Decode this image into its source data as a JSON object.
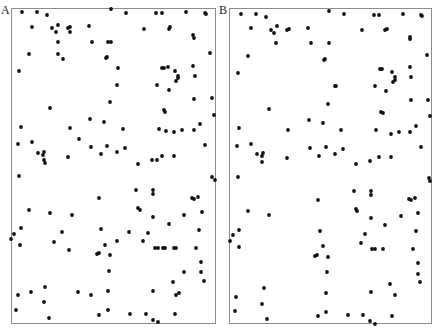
{
  "figure": {
    "panels": [
      {
        "label": "A",
        "frame": {
          "left": 11,
          "top": 8,
          "right": 215,
          "bottom": 323
        }
      },
      {
        "label": "B",
        "frame": {
          "left": 229,
          "top": 8,
          "right": 431,
          "bottom": 323
        }
      }
    ],
    "dot_color": "#111111",
    "frame_color": "#8c8c8c",
    "dot_radius": 1.9
  },
  "chart_data": [
    {
      "type": "scatter",
      "title": "A",
      "xlabel": "",
      "ylabel": "",
      "axes": "none",
      "grid": false,
      "legend": false,
      "coordinate_system": "image pixels (absolute)",
      "points": [
        [
          22,
          12
        ],
        [
          37,
          12
        ],
        [
          47,
          15
        ],
        [
          111,
          9
        ],
        [
          126,
          13
        ],
        [
          156,
          13
        ],
        [
          162,
          13
        ],
        [
          186,
          12
        ],
        [
          205,
          13
        ],
        [
          206,
          14
        ],
        [
          32,
          27
        ],
        [
          52,
          28
        ],
        [
          58,
          25
        ],
        [
          56,
          32
        ],
        [
          68,
          28
        ],
        [
          70,
          27
        ],
        [
          70,
          32
        ],
        [
          89,
          26
        ],
        [
          144,
          29
        ],
        [
          169,
          29
        ],
        [
          170,
          27
        ],
        [
          193,
          35
        ],
        [
          194,
          38
        ],
        [
          58,
          42
        ],
        [
          92,
          42
        ],
        [
          108,
          42
        ],
        [
          111,
          42
        ],
        [
          29,
          54
        ],
        [
          58,
          54
        ],
        [
          63,
          59
        ],
        [
          106,
          58
        ],
        [
          107,
          57
        ],
        [
          210,
          53
        ],
        [
          19,
          71
        ],
        [
          118,
          68
        ],
        [
          162,
          68
        ],
        [
          164,
          68
        ],
        [
          168,
          67
        ],
        [
          175,
          71
        ],
        [
          178,
          76
        ],
        [
          178,
          78
        ],
        [
          176,
          81
        ],
        [
          193,
          66
        ],
        [
          195,
          76
        ],
        [
          117,
          85
        ],
        [
          157,
          85
        ],
        [
          169,
          90
        ],
        [
          194,
          99
        ],
        [
          212,
          98
        ],
        [
          50,
          108
        ],
        [
          110,
          102
        ],
        [
          164,
          110
        ],
        [
          165,
          112
        ],
        [
          214,
          115
        ],
        [
          21,
          127
        ],
        [
          70,
          128
        ],
        [
          90,
          119
        ],
        [
          104,
          122
        ],
        [
          123,
          129
        ],
        [
          159,
          129
        ],
        [
          166,
          131
        ],
        [
          174,
          132
        ],
        [
          182,
          130
        ],
        [
          194,
          130
        ],
        [
          200,
          124
        ],
        [
          18,
          144
        ],
        [
          32,
          142
        ],
        [
          79,
          139
        ],
        [
          91,
          147
        ],
        [
          107,
          146
        ],
        [
          125,
          148
        ],
        [
          205,
          145
        ],
        [
          38,
          153
        ],
        [
          44,
          152
        ],
        [
          43,
          155
        ],
        [
          44,
          160
        ],
        [
          45,
          163
        ],
        [
          68,
          157
        ],
        [
          101,
          154
        ],
        [
          117,
          152
        ],
        [
          152,
          160
        ],
        [
          157,
          160
        ],
        [
          162,
          156
        ],
        [
          174,
          156
        ],
        [
          138,
          164
        ],
        [
          19,
          176
        ],
        [
          212,
          177
        ],
        [
          215,
          180
        ],
        [
          136,
          190
        ],
        [
          153,
          190
        ],
        [
          153,
          194
        ],
        [
          99,
          198
        ],
        [
          192,
          198
        ],
        [
          194,
          199
        ],
        [
          198,
          197
        ],
        [
          29,
          210
        ],
        [
          50,
          213
        ],
        [
          72,
          215
        ],
        [
          138,
          208
        ],
        [
          140,
          210
        ],
        [
          153,
          217
        ],
        [
          184,
          215
        ],
        [
          202,
          212
        ],
        [
          21,
          228
        ],
        [
          14,
          234
        ],
        [
          11,
          239
        ],
        [
          20,
          245
        ],
        [
          62,
          232
        ],
        [
          54,
          242
        ],
        [
          69,
          250
        ],
        [
          101,
          229
        ],
        [
          129,
          232
        ],
        [
          148,
          233
        ],
        [
          169,
          224
        ],
        [
          199,
          230
        ],
        [
          117,
          241
        ],
        [
          143,
          241
        ],
        [
          105,
          245
        ],
        [
          97,
          254
        ],
        [
          99,
          253
        ],
        [
          110,
          255
        ],
        [
          155,
          248
        ],
        [
          158,
          248
        ],
        [
          163,
          248
        ],
        [
          165,
          248
        ],
        [
          174,
          248
        ],
        [
          176,
          248
        ],
        [
          196,
          248
        ],
        [
          201,
          262
        ],
        [
          109,
          271
        ],
        [
          184,
          272
        ],
        [
          201,
          272
        ],
        [
          204,
          281
        ],
        [
          173,
          282
        ],
        [
          18,
          295
        ],
        [
          31,
          292
        ],
        [
          45,
          287
        ],
        [
          78,
          292
        ],
        [
          91,
          295
        ],
        [
          108,
          291
        ],
        [
          153,
          291
        ],
        [
          176,
          295
        ],
        [
          179,
          293
        ],
        [
          44,
          302
        ],
        [
          16,
          310
        ],
        [
          49,
          318
        ],
        [
          99,
          315
        ],
        [
          108,
          310
        ],
        [
          130,
          314
        ],
        [
          146,
          314
        ],
        [
          153,
          320
        ],
        [
          158,
          322
        ],
        [
          175,
          314
        ]
      ]
    },
    {
      "type": "scatter",
      "title": "B",
      "xlabel": "",
      "ylabel": "",
      "axes": "none",
      "grid": false,
      "legend": false,
      "coordinate_system": "image pixels (absolute)",
      "points": [
        [
          241,
          14
        ],
        [
          256,
          14
        ],
        [
          266,
          17
        ],
        [
          329,
          11
        ],
        [
          344,
          14
        ],
        [
          374,
          15
        ],
        [
          379,
          15
        ],
        [
          403,
          14
        ],
        [
          421,
          15
        ],
        [
          422,
          16
        ],
        [
          251,
          28
        ],
        [
          271,
          30
        ],
        [
          277,
          26
        ],
        [
          274,
          33
        ],
        [
          287,
          30
        ],
        [
          289,
          29
        ],
        [
          308,
          28
        ],
        [
          362,
          30
        ],
        [
          385,
          30
        ],
        [
          387,
          29
        ],
        [
          410,
          37
        ],
        [
          410,
          39
        ],
        [
          276,
          43
        ],
        [
          311,
          43
        ],
        [
          329,
          43
        ],
        [
          248,
          56
        ],
        [
          324,
          60
        ],
        [
          325,
          59
        ],
        [
          427,
          55
        ],
        [
          238,
          73
        ],
        [
          380,
          69
        ],
        [
          382,
          69
        ],
        [
          392,
          72
        ],
        [
          395,
          77
        ],
        [
          395,
          80
        ],
        [
          393,
          82
        ],
        [
          410,
          67
        ],
        [
          411,
          77
        ],
        [
          335,
          86
        ],
        [
          336,
          86
        ],
        [
          375,
          86
        ],
        [
          386,
          91
        ],
        [
          411,
          100
        ],
        [
          428,
          100
        ],
        [
          269,
          109
        ],
        [
          328,
          104
        ],
        [
          381,
          112
        ],
        [
          383,
          113
        ],
        [
          430,
          116
        ],
        [
          239,
          128
        ],
        [
          288,
          130
        ],
        [
          309,
          120
        ],
        [
          323,
          123
        ],
        [
          341,
          130
        ],
        [
          376,
          130
        ],
        [
          391,
          134
        ],
        [
          399,
          132
        ],
        [
          410,
          132
        ],
        [
          416,
          126
        ],
        [
          237,
          146
        ],
        [
          251,
          144
        ],
        [
          310,
          148
        ],
        [
          326,
          147
        ],
        [
          343,
          149
        ],
        [
          421,
          147
        ],
        [
          257,
          154
        ],
        [
          263,
          153
        ],
        [
          262,
          156
        ],
        [
          262,
          162
        ],
        [
          287,
          158
        ],
        [
          319,
          156
        ],
        [
          335,
          154
        ],
        [
          370,
          161
        ],
        [
          379,
          157
        ],
        [
          391,
          157
        ],
        [
          356,
          164
        ],
        [
          238,
          177
        ],
        [
          429,
          178
        ],
        [
          430,
          181
        ],
        [
          354,
          191
        ],
        [
          371,
          191
        ],
        [
          371,
          195
        ],
        [
          318,
          200
        ],
        [
          409,
          199
        ],
        [
          411,
          200
        ],
        [
          415,
          198
        ],
        [
          248,
          211
        ],
        [
          269,
          215
        ],
        [
          356,
          209
        ],
        [
          357,
          211
        ],
        [
          371,
          218
        ],
        [
          401,
          216
        ],
        [
          418,
          213
        ],
        [
          239,
          230
        ],
        [
          233,
          235
        ],
        [
          230,
          241
        ],
        [
          239,
          247
        ],
        [
          320,
          231
        ],
        [
          365,
          234
        ],
        [
          385,
          225
        ],
        [
          416,
          231
        ],
        [
          361,
          243
        ],
        [
          323,
          246
        ],
        [
          315,
          256
        ],
        [
          317,
          255
        ],
        [
          328,
          257
        ],
        [
          372,
          249
        ],
        [
          375,
          249
        ],
        [
          383,
          249
        ],
        [
          413,
          249
        ],
        [
          418,
          263
        ],
        [
          327,
          272
        ],
        [
          418,
          274
        ],
        [
          420,
          282
        ],
        [
          390,
          284
        ],
        [
          264,
          288
        ],
        [
          236,
          297
        ],
        [
          262,
          304
        ],
        [
          326,
          293
        ],
        [
          371,
          292
        ],
        [
          395,
          295
        ],
        [
          235,
          311
        ],
        [
          267,
          319
        ],
        [
          318,
          316
        ],
        [
          326,
          312
        ],
        [
          348,
          315
        ],
        [
          363,
          315
        ],
        [
          370,
          321
        ],
        [
          375,
          324
        ],
        [
          392,
          316
        ]
      ]
    }
  ]
}
